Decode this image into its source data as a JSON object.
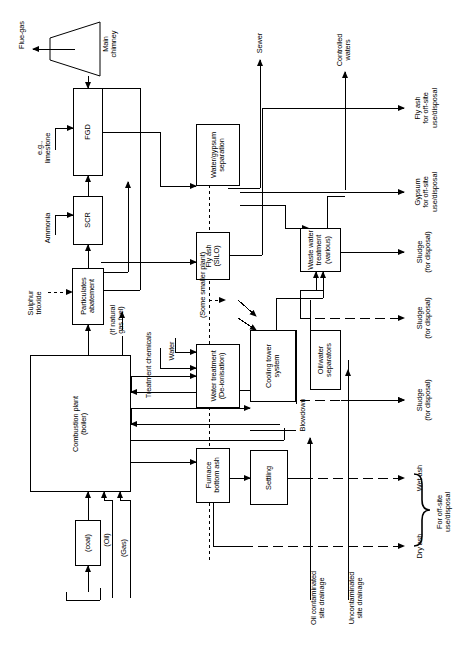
{
  "figure": {
    "type": "process-flow-diagram",
    "orientation": "landscape figure rotated 90 degrees counter-clockwise on a portrait page",
    "line_color": "#000000",
    "background_color": "#ffffff"
  },
  "process_boxes": [
    {
      "id": "main-chimney",
      "label": "Main\nchimney",
      "shape": "trapezoid"
    },
    {
      "id": "fgd",
      "label": "FGD",
      "shape": "rect"
    },
    {
      "id": "scr",
      "label": "SCR",
      "shape": "rect"
    },
    {
      "id": "particulates",
      "label": "Particulates\nabatement",
      "shape": "rect"
    },
    {
      "id": "water-gypsum",
      "label": "Water/gypsum\nseparation",
      "shape": "rect"
    },
    {
      "id": "fly-ash-silo",
      "label": "Fly ash\n(SILO)",
      "shape": "rect"
    },
    {
      "id": "waste-water",
      "label": "Waste water\ntreatment\n(various)",
      "shape": "rect"
    },
    {
      "id": "water-treatment",
      "label": "Water treatment\n(De-ionisation)",
      "shape": "rect"
    },
    {
      "id": "cooling-tower",
      "label": "Cooling tower\nsystem",
      "shape": "rect"
    },
    {
      "id": "oil-water-separators",
      "label": "Oil/water\nseparators",
      "shape": "rect"
    },
    {
      "id": "combustion-plant",
      "label": "Combustion plant\n(boiler)",
      "shape": "rect"
    },
    {
      "id": "furnace-bottom-ash",
      "label": "Furnace\nbottom ash",
      "shape": "rect"
    },
    {
      "id": "settling",
      "label": "Settling",
      "shape": "rect"
    },
    {
      "id": "coal",
      "label": "(coal)",
      "shape": "rect"
    }
  ],
  "input_labels": [
    {
      "id": "eg-limestone",
      "label": "e.g.,\nlimestone"
    },
    {
      "id": "ammonia",
      "label": "Ammonia"
    },
    {
      "id": "sulphur-trioxide",
      "label": "Sulphur\ntrioxide"
    },
    {
      "id": "if-natural-gas-fuel",
      "label": "(If natural\ngas fuel)"
    },
    {
      "id": "treatment-chemicals",
      "label": "Treatment chemicals"
    },
    {
      "id": "water",
      "label": "Water"
    },
    {
      "id": "oil",
      "label": "(Oil)"
    },
    {
      "id": "gas",
      "label": "(Gas)"
    }
  ],
  "output_labels": [
    {
      "id": "flue-gas",
      "label": "Flue-gas"
    },
    {
      "id": "sewer",
      "label": "Sewer"
    },
    {
      "id": "controlled-waters",
      "label": "Controlled\nwaters"
    },
    {
      "id": "fly-ash-offsite",
      "label": "Fly ash\nfor off-site\nuse/disposal"
    },
    {
      "id": "gypsum-offsite",
      "label": "Gypsum\nfor off-site\nuse/disposal"
    },
    {
      "id": "sludge-1",
      "label": "Sludge\n(for disposal)"
    },
    {
      "id": "sludge-2",
      "label": "Sludge\n(for disposal)"
    },
    {
      "id": "sludge-3",
      "label": "Sludge\n(for disposal)"
    },
    {
      "id": "wet-ash",
      "label": "Wet ash"
    },
    {
      "id": "dry-ash",
      "label": "Dry ash"
    },
    {
      "id": "for-offsite",
      "label": "For off-site\nuse/disposal"
    }
  ],
  "stream_labels": [
    {
      "id": "some-smaller-plant",
      "label": "(Some smaller plant)"
    },
    {
      "id": "blowdown",
      "label": "Blowdown"
    },
    {
      "id": "oil-contaminated-drainage",
      "label": "Oil contaminated\nsite drainage"
    },
    {
      "id": "uncontaminated-drainage",
      "label": "Uncontaminated\nsite drainage"
    }
  ],
  "text": {
    "main_chimney": "Main\nchimney",
    "fgd": "FGD",
    "scr": "SCR",
    "particulates": "Particulates\nabatement",
    "water_gypsum": "Water/gypsum\nseparation",
    "fly_ash_silo": "Fly ash\n(SILO)",
    "waste_water": "Waste water\ntreatment\n(various)",
    "water_treatment": "Water treatment\n(De-ionisation)",
    "cooling_tower": "Cooling tower\nsystem",
    "oil_water_separators": "Oil/water\nseparators",
    "combustion_plant": "Combustion plant\n(boiler)",
    "furnace_bottom_ash": "Furnace\nbottom ash",
    "settling": "Settling",
    "coal": "(coal)",
    "oil": "(Oil)",
    "gas": "(Gas)",
    "eg_limestone": "e.g.,\nlimestone",
    "ammonia": "Ammonia",
    "sulphur_trioxide": "Sulphur\ntrioxide",
    "if_natural_gas_fuel": "(If natural\ngas fuel)",
    "treatment_chemicals": "Treatment chemicals",
    "water": "Water",
    "flue_gas": "Flue-gas",
    "sewer": "Sewer",
    "controlled_waters": "Controlled\nwaters",
    "fly_ash_offsite": "Fly ash\nfor off-site\nuse/disposal",
    "gypsum_offsite": "Gypsum\nfor off-site\nuse/disposal",
    "sludge_1": "Sludge\n(for disposal)",
    "sludge_2": "Sludge\n(for disposal)",
    "sludge_3": "Sludge\n(for disposal)",
    "wet_ash": "Wet ash",
    "dry_ash": "Dry ash",
    "for_offsite": "For off-site\nuse/disposal",
    "some_smaller_plant": "(Some smaller plant)",
    "blowdown": "Blowdown",
    "oil_contaminated_drainage": "Oil contaminated\nsite drainage",
    "uncontaminated_drainage": "Uncontaminated\nsite drainage"
  }
}
